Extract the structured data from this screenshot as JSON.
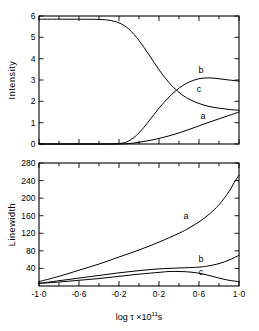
{
  "figure": {
    "background": "#ffffff",
    "ink_color": "#000000"
  },
  "chart_data": [
    {
      "type": "line",
      "panel": "top",
      "title": "",
      "xlabel": "",
      "ylabel": "Intensity",
      "xlim": [
        -1.0,
        1.0
      ],
      "ylim": [
        0,
        6
      ],
      "grid": false,
      "legend_position": "inline-curve-labels",
      "xticks": [
        -1.0,
        -0.6,
        -0.2,
        0.2,
        0.6,
        1.0
      ],
      "xticklabels": [
        "-1·0",
        "-0·6",
        "-0·2",
        "0·2",
        "0·6",
        "1·0"
      ],
      "xminorticks": [
        -0.8,
        -0.4,
        0.0,
        0.4,
        0.8
      ],
      "yticks": [
        0,
        1,
        2,
        3,
        4,
        5,
        6
      ],
      "yticklabels": [
        "0",
        "1",
        "2",
        "3",
        "4",
        "5",
        "6"
      ],
      "series": [
        {
          "name": "a",
          "label": "a",
          "label_x": 0.64,
          "label_y": 1.18,
          "x": [
            -1.0,
            -0.8,
            -0.6,
            -0.4,
            -0.2,
            -0.1,
            0.0,
            0.1,
            0.2,
            0.3,
            0.4,
            0.5,
            0.6,
            0.7,
            0.8,
            0.9,
            1.0
          ],
          "values": [
            0.0,
            0.0,
            0.0,
            0.0,
            0.0,
            0.02,
            0.08,
            0.16,
            0.26,
            0.38,
            0.52,
            0.68,
            0.85,
            1.02,
            1.18,
            1.34,
            1.5
          ]
        },
        {
          "name": "b",
          "label": "b",
          "label_x": 0.62,
          "label_y": 3.32,
          "x": [
            -1.0,
            -0.8,
            -0.6,
            -0.4,
            -0.2,
            -0.1,
            0.0,
            0.1,
            0.2,
            0.3,
            0.4,
            0.5,
            0.6,
            0.7,
            0.8,
            0.9,
            1.0
          ],
          "values": [
            0.0,
            0.0,
            0.0,
            0.0,
            0.02,
            0.15,
            0.52,
            1.08,
            1.68,
            2.2,
            2.62,
            2.9,
            3.06,
            3.1,
            3.06,
            3.0,
            2.95
          ]
        },
        {
          "name": "c",
          "label": "c",
          "label_x": 0.6,
          "label_y": 2.42,
          "x": [
            -1.0,
            -0.8,
            -0.6,
            -0.4,
            -0.3,
            -0.2,
            -0.1,
            0.0,
            0.1,
            0.2,
            0.3,
            0.4,
            0.5,
            0.6,
            0.7,
            0.8,
            0.9,
            1.0
          ],
          "values": [
            5.85,
            5.85,
            5.85,
            5.84,
            5.8,
            5.68,
            5.38,
            4.85,
            4.18,
            3.48,
            2.88,
            2.42,
            2.1,
            1.9,
            1.76,
            1.68,
            1.62,
            1.58
          ]
        }
      ]
    },
    {
      "type": "line",
      "panel": "bottom",
      "title": "",
      "xlabel": "log τ ×10¹¹s",
      "ylabel": "Linewidth",
      "xlim": [
        -1.0,
        1.0
      ],
      "ylim": [
        0,
        280
      ],
      "grid": false,
      "legend_position": "inline-curve-labels",
      "xticks": [
        -1.0,
        -0.6,
        -0.2,
        0.2,
        0.6,
        1.0
      ],
      "xticklabels": [
        "-1·0",
        "-0·6",
        "-0·2",
        "0·2",
        "0·6",
        "1·0"
      ],
      "xminorticks": [
        -0.8,
        -0.4,
        0.0,
        0.4,
        0.8
      ],
      "yticks": [
        40,
        80,
        120,
        160,
        200,
        240,
        280
      ],
      "yticklabels": [
        "40",
        "80",
        "120",
        "160",
        "200",
        "240",
        "280"
      ],
      "series": [
        {
          "name": "a",
          "label": "a",
          "label_x": 0.47,
          "label_y": 152,
          "x": [
            -1.0,
            -0.8,
            -0.6,
            -0.4,
            -0.2,
            0.0,
            0.2,
            0.4,
            0.5,
            0.6,
            0.7,
            0.8,
            0.9,
            0.95,
            1.0
          ],
          "values": [
            10,
            22,
            36,
            50,
            66,
            82,
            100,
            120,
            132,
            146,
            163,
            185,
            215,
            235,
            252
          ]
        },
        {
          "name": "b",
          "label": "b",
          "label_x": 0.62,
          "label_y": 55,
          "x": [
            -1.0,
            -0.8,
            -0.6,
            -0.4,
            -0.2,
            0.0,
            0.2,
            0.4,
            0.6,
            0.7,
            0.8,
            0.9,
            1.0
          ],
          "values": [
            6,
            12,
            18,
            24,
            30,
            35,
            39,
            41,
            43,
            46,
            51,
            59,
            70
          ]
        },
        {
          "name": "c",
          "label": "c",
          "label_x": 0.62,
          "label_y": 26,
          "x": [
            -1.0,
            -0.8,
            -0.6,
            -0.4,
            -0.2,
            0.0,
            0.2,
            0.3,
            0.4,
            0.5,
            0.6,
            0.7,
            0.8,
            0.9,
            1.0
          ],
          "values": [
            6,
            9,
            13,
            17,
            22,
            27,
            31,
            33,
            33,
            32,
            29,
            24,
            18,
            13,
            10
          ]
        }
      ]
    }
  ]
}
